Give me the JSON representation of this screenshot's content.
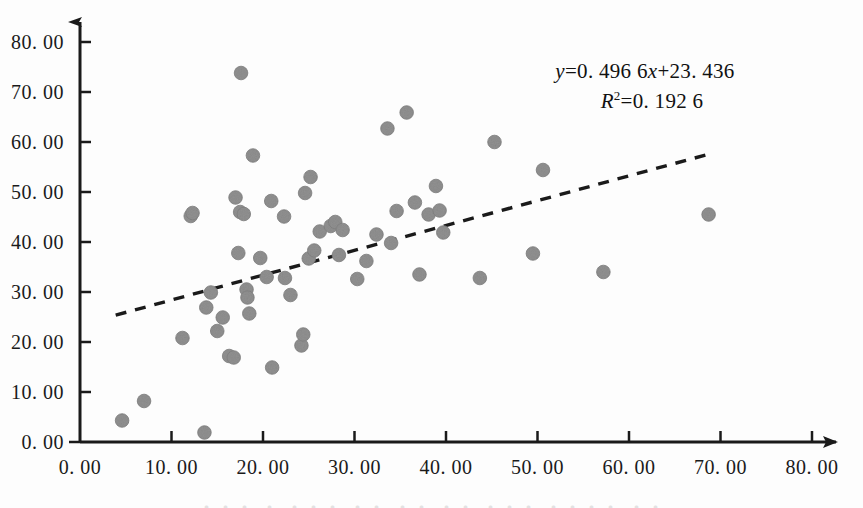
{
  "figure": {
    "background_color": "#fdfdfd",
    "axis_color": "#1a1a1a",
    "marker_color": "#909090",
    "marker_edge_color": "#7d7d7d",
    "trendline_color": "#1a1a1a",
    "text_color": "#111111"
  },
  "annotations": {
    "equation_y": "y",
    "equation_body": "=0. 496  6",
    "equation_x": "x",
    "equation_tail": "+23. 436",
    "r_squared_symbol": "R",
    "r_squared_exponent": "2",
    "r_squared_value": "=0. 192  6",
    "equation_full": "y=0. 496  6x+23. 436",
    "r_squared_full": "R2=0. 192  6"
  },
  "caption_sliver": "・・・ ・ ・・・ ・・ ・・ ・・ ・・・ ・・・・ ・・",
  "chart_data": {
    "type": "scatter",
    "title": "",
    "xlabel": "",
    "ylabel": "",
    "xlim": [
      0,
      80
    ],
    "ylim": [
      0,
      80
    ],
    "xticks": [
      0,
      10,
      20,
      30,
      40,
      50,
      60,
      70,
      80
    ],
    "yticks": [
      0,
      10,
      20,
      30,
      40,
      50,
      60,
      70,
      80
    ],
    "xtick_labels": [
      "0. 00",
      "10. 00",
      "20. 00",
      "30. 00",
      "40. 00",
      "50. 00",
      "60. 00",
      "70. 00",
      "80. 00"
    ],
    "ytick_labels": [
      "0. 00",
      "10. 00",
      "20. 00",
      "30. 00",
      "40. 00",
      "50. 00",
      "60. 00",
      "70. 00",
      "80. 00"
    ],
    "grid": false,
    "legend": false,
    "marker_radius_px": 6.8,
    "axis_style": "arrow-tipped-left-bottom-spines",
    "trendline": {
      "type": "linear-dashed",
      "slope": 0.4966,
      "intercept": 23.436,
      "r_squared": 0.1926,
      "x_start": 3.9,
      "x_end": 69.0,
      "label": "y=0. 496  6x+23. 436"
    },
    "points": [
      [
        4.6,
        4.3
      ],
      [
        7.0,
        8.2
      ],
      [
        11.2,
        20.8
      ],
      [
        12.1,
        45.2
      ],
      [
        12.3,
        45.8
      ],
      [
        13.6,
        1.9
      ],
      [
        13.8,
        26.9
      ],
      [
        14.3,
        29.9
      ],
      [
        15.0,
        22.2
      ],
      [
        15.6,
        24.9
      ],
      [
        16.3,
        17.2
      ],
      [
        16.8,
        16.9
      ],
      [
        17.0,
        48.9
      ],
      [
        17.3,
        37.8
      ],
      [
        17.5,
        46.0
      ],
      [
        17.6,
        73.8
      ],
      [
        17.9,
        45.6
      ],
      [
        18.2,
        30.5
      ],
      [
        18.3,
        28.9
      ],
      [
        18.5,
        25.7
      ],
      [
        18.9,
        57.3
      ],
      [
        19.7,
        36.8
      ],
      [
        20.4,
        33.0
      ],
      [
        20.9,
        48.2
      ],
      [
        21.0,
        14.9
      ],
      [
        22.3,
        45.1
      ],
      [
        22.4,
        32.8
      ],
      [
        23.0,
        29.4
      ],
      [
        24.2,
        19.3
      ],
      [
        24.4,
        21.5
      ],
      [
        24.6,
        49.8
      ],
      [
        25.0,
        36.7
      ],
      [
        25.2,
        53.0
      ],
      [
        25.6,
        38.3
      ],
      [
        26.2,
        42.1
      ],
      [
        27.4,
        43.2
      ],
      [
        27.9,
        44.0
      ],
      [
        28.3,
        37.4
      ],
      [
        28.7,
        42.4
      ],
      [
        30.3,
        32.6
      ],
      [
        31.3,
        36.2
      ],
      [
        32.4,
        41.5
      ],
      [
        33.6,
        62.7
      ],
      [
        34.0,
        39.8
      ],
      [
        34.6,
        46.2
      ],
      [
        35.7,
        65.9
      ],
      [
        36.6,
        47.9
      ],
      [
        37.1,
        33.5
      ],
      [
        38.1,
        45.5
      ],
      [
        38.9,
        51.2
      ],
      [
        39.3,
        46.3
      ],
      [
        39.7,
        41.9
      ],
      [
        43.7,
        32.8
      ],
      [
        45.3,
        60.0
      ],
      [
        49.5,
        37.7
      ],
      [
        50.6,
        54.4
      ],
      [
        57.2,
        34.0
      ],
      [
        68.7,
        45.5
      ]
    ]
  }
}
